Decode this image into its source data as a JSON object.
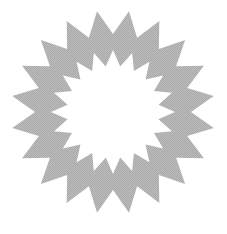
{
  "shape": {
    "type": "starburst-ring",
    "points": 20,
    "fill": "#b4b4b4",
    "background": "#ffffff",
    "center": [
      113,
      112
    ],
    "outer_radius": 102,
    "outer_valley_radius": 78,
    "inner_radius": 62,
    "inner_valley_radius": 46
  }
}
